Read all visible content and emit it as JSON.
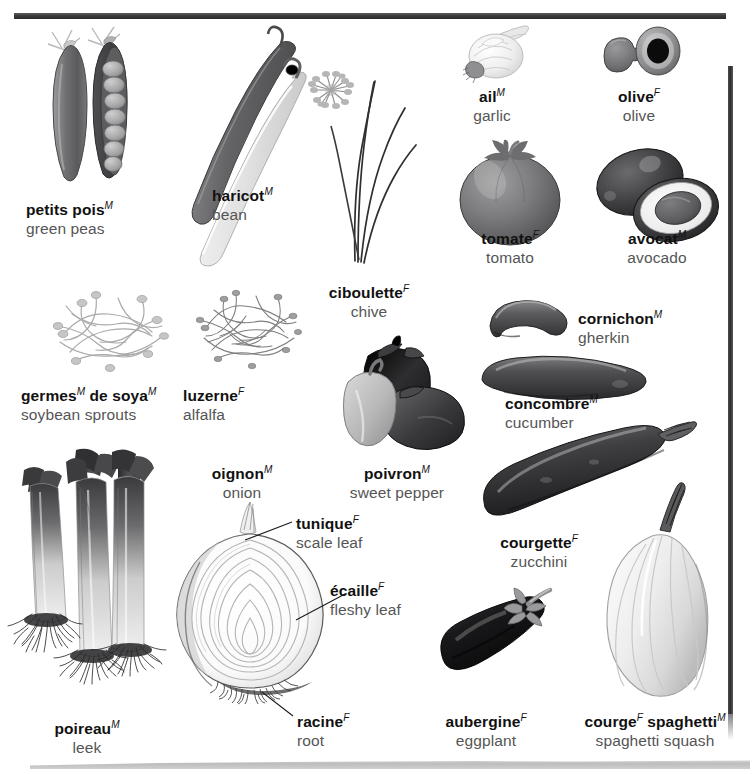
{
  "page": {
    "language_pair": "French / English",
    "background_color": "#ffffff",
    "rule_color": "#303032"
  },
  "entries": [
    {
      "id": "petits-pois",
      "fr": "petits pois",
      "gender": "M",
      "en": "green peas",
      "x": 84,
      "y": 200
    },
    {
      "id": "haricot",
      "fr": "haricot",
      "gender": "M",
      "en": "bean",
      "x": 212,
      "y": 185
    },
    {
      "id": "ciboulette",
      "fr": "ciboulette",
      "gender": "F",
      "en": "chive",
      "x": 369,
      "y": 283
    },
    {
      "id": "ail",
      "fr": "ail",
      "gender": "M",
      "en": "garlic",
      "x": 492,
      "y": 87
    },
    {
      "id": "olive",
      "fr": "olive",
      "gender": "F",
      "en": "olive",
      "x": 639,
      "y": 87
    },
    {
      "id": "tomate",
      "fr": "tomate",
      "gender": "F",
      "en": "tomato",
      "x": 510,
      "y": 228
    },
    {
      "id": "avocat",
      "fr": "avocat",
      "gender": "M",
      "en": "avocado",
      "x": 657,
      "y": 228
    },
    {
      "id": "germes-soya",
      "fr": "germes",
      "gender": "M",
      "fr2": "de soya",
      "gender2": "M",
      "en": "soybean sprouts",
      "x": 21,
      "y": 385
    },
    {
      "id": "luzerne",
      "fr": "luzerne",
      "gender": "F",
      "en": "alfalfa",
      "x": 183,
      "y": 385
    },
    {
      "id": "cornichon",
      "fr": "cornichon",
      "gender": "M",
      "en": "gherkin",
      "x": 578,
      "y": 308
    },
    {
      "id": "concombre",
      "fr": "concombre",
      "gender": "M",
      "en": "cucumber",
      "x": 505,
      "y": 393
    },
    {
      "id": "oignon",
      "fr": "oignon",
      "gender": "M",
      "en": "onion",
      "x": 208,
      "y": 463
    },
    {
      "id": "poivron",
      "fr": "poivron",
      "gender": "M",
      "en": "sweet pepper",
      "x": 397,
      "y": 463
    },
    {
      "id": "courgette",
      "fr": "courgette",
      "gender": "F",
      "en": "zucchini",
      "x": 495,
      "y": 532
    },
    {
      "id": "poireau",
      "fr": "poireau",
      "gender": "M",
      "en": "leek",
      "x": 46,
      "y": 718
    },
    {
      "id": "aubergine",
      "fr": "aubergine",
      "gender": "F",
      "en": "eggplant",
      "x": 443,
      "y": 711
    },
    {
      "id": "courge-spaghetti",
      "fr": "courge",
      "gender": "F",
      "fr2": "spaghetti",
      "gender2": "M",
      "en": "spaghetti squash",
      "x": 578,
      "y": 711
    }
  ],
  "callouts": [
    {
      "id": "tunique",
      "fr": "tunique",
      "gender": "F",
      "en": "scale leaf",
      "x": 296,
      "y": 513
    },
    {
      "id": "ecaille",
      "fr": "écaille",
      "gender": "F",
      "en": "fleshy leaf",
      "x": 330,
      "y": 580
    },
    {
      "id": "racine",
      "fr": "racine",
      "gender": "F",
      "en": "root",
      "x": 297,
      "y": 711
    }
  ],
  "illustrations": [
    {
      "id": "pea-pods",
      "name": "green-pea-pods-illustration",
      "label": "petits pois"
    },
    {
      "id": "bean-pods",
      "name": "bean-pods-illustration",
      "label": "haricot"
    },
    {
      "id": "chive-plant",
      "name": "chive-plant-illustration",
      "label": "ciboulette"
    },
    {
      "id": "garlic-bulb",
      "name": "garlic-bulb-illustration",
      "label": "ail"
    },
    {
      "id": "olives",
      "name": "olives-illustration",
      "label": "olive"
    },
    {
      "id": "tomato",
      "name": "tomato-illustration",
      "label": "tomate"
    },
    {
      "id": "avocado",
      "name": "avocado-illustration",
      "label": "avocat"
    },
    {
      "id": "soybean-sprouts",
      "name": "soybean-sprouts-illustration",
      "label": "germes de soya"
    },
    {
      "id": "alfalfa",
      "name": "alfalfa-sprouts-illustration",
      "label": "luzerne"
    },
    {
      "id": "gherkin",
      "name": "gherkin-illustration",
      "label": "cornichon"
    },
    {
      "id": "cucumber",
      "name": "cucumber-illustration",
      "label": "concombre"
    },
    {
      "id": "sweet-peppers",
      "name": "sweet-peppers-illustration",
      "label": "poivron"
    },
    {
      "id": "zucchini",
      "name": "zucchini-illustration",
      "label": "courgette"
    },
    {
      "id": "onion-section",
      "name": "onion-cross-section-illustration",
      "label": "oignon"
    },
    {
      "id": "leeks",
      "name": "leeks-illustration",
      "label": "poireau"
    },
    {
      "id": "eggplant",
      "name": "eggplant-illustration",
      "label": "aubergine"
    },
    {
      "id": "spaghetti-squash",
      "name": "spaghetti-squash-illustration",
      "label": "courge spaghetti"
    }
  ]
}
